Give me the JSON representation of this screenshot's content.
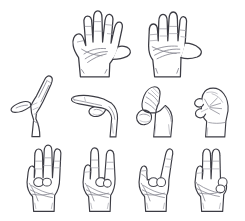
{
  "sheet": {
    "title": "Hand gesture line art sheet",
    "description": "Ten black-and-white line drawings of hand poses arranged in three rows on a plain white background",
    "background_color": "#ffffff",
    "outline_color": "#3c3c44",
    "crease_color": "#8b8b95",
    "width": 245,
    "height": 221,
    "style": "pen-and-ink contour line drawing, no shading, no fill"
  },
  "rows": [
    {
      "index": 0,
      "name": "top-row",
      "count": 2,
      "hands": [
        {
          "id": "hand-open-palm-spread",
          "label": "Open palm, fingers spread",
          "gesture": "five / open hand",
          "orientation": "palm facing viewer, left hand",
          "extended_fingers": 5,
          "x": 60,
          "y": 6,
          "w": 72,
          "h": 72
        },
        {
          "id": "hand-four-fingers-thumb-out",
          "label": "Four fingers together, thumb extended sideways",
          "gesture": "four",
          "orientation": "palm facing viewer, right hand",
          "extended_fingers": 4,
          "x": 133,
          "y": 6,
          "w": 72,
          "h": 72
        }
      ]
    },
    {
      "index": 1,
      "name": "middle-row",
      "count": 4,
      "hands": [
        {
          "id": "hand-index-up-thumb-out-side",
          "label": "Index finger raised, thumb out, side view",
          "gesture": "one / L-shape",
          "orientation": "side view, profile",
          "extended_fingers": 2,
          "x": 6,
          "y": 70,
          "w": 62,
          "h": 68
        },
        {
          "id": "hand-index-pointing-side",
          "label": "Index finger pointing, thumb curled, side view",
          "gesture": "pointing",
          "orientation": "side view, profile",
          "extended_fingers": 1,
          "x": 66,
          "y": 82,
          "w": 62,
          "h": 56
        },
        {
          "id": "hand-closed-fist-thumb-side",
          "label": "Closed fist with thumb alongside, side view",
          "gesture": "fist / A-shape",
          "orientation": "side view, profile",
          "extended_fingers": 0,
          "x": 127,
          "y": 82,
          "w": 56,
          "h": 56
        },
        {
          "id": "hand-closed-fist-front",
          "label": "Closed fist, knuckles toward viewer",
          "gesture": "fist / S-shape",
          "orientation": "three-quarter view",
          "extended_fingers": 0,
          "x": 185,
          "y": 82,
          "w": 54,
          "h": 56
        }
      ]
    },
    {
      "index": 2,
      "name": "bottom-row",
      "count": 4,
      "hands": [
        {
          "id": "hand-three-fingers-up",
          "label": "Three fingers raised, thumb and little finger folded",
          "gesture": "three / W-shape",
          "orientation": "palm facing viewer",
          "extended_fingers": 3,
          "x": 16,
          "y": 142,
          "w": 58,
          "h": 72
        },
        {
          "id": "hand-two-fingers-split",
          "label": "Index and middle raised with gap, other fingers folded",
          "gesture": "two / V-shape",
          "orientation": "palm facing viewer",
          "extended_fingers": 2,
          "x": 72,
          "y": 142,
          "w": 58,
          "h": 72
        },
        {
          "id": "hand-horns-index-pinky",
          "label": "Index and little finger raised, middle fingers folded",
          "gesture": "horns / ILY-shape",
          "orientation": "palm facing viewer",
          "extended_fingers": 2,
          "x": 128,
          "y": 142,
          "w": 58,
          "h": 72
        },
        {
          "id": "hand-two-fingers-together",
          "label": "Index and middle raised together, ring and little folded",
          "gesture": "two / U-shape",
          "orientation": "palm facing viewer",
          "extended_fingers": 2,
          "x": 184,
          "y": 142,
          "w": 58,
          "h": 72
        }
      ]
    }
  ]
}
